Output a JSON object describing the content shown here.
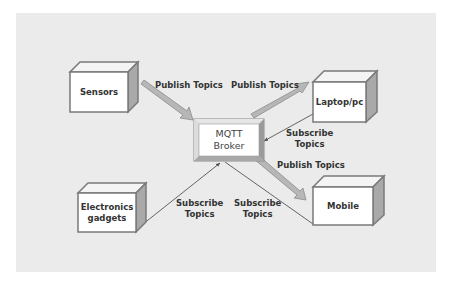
{
  "diagram": {
    "type": "mqtt-architecture",
    "colors": {
      "background_panel": "#ebebeb",
      "box_fill": "#ffffff",
      "box_border": "#7a7a7a",
      "box_side": "#a9a9a9",
      "box_top": "#f4f4f4",
      "publish_arrow": "#b5b5b5",
      "subscribe_line": "#555555"
    },
    "broker": {
      "line1": "MQTT",
      "line2": "Broker"
    },
    "nodes": [
      {
        "id": "sensors",
        "label": "Sensors"
      },
      {
        "id": "laptop",
        "label": "Laptop/pc"
      },
      {
        "id": "electronics",
        "line1": "Electronics",
        "line2": "gadgets"
      },
      {
        "id": "mobile",
        "label": "Mobile"
      }
    ],
    "edges": [
      {
        "from": "sensors",
        "to": "broker",
        "kind": "publish",
        "label": "Publish Topics"
      },
      {
        "from": "broker",
        "to": "laptop",
        "kind": "publish",
        "label": "Publish Topics"
      },
      {
        "from": "laptop",
        "to": "broker",
        "kind": "subscribe",
        "line1": "Subscribe",
        "line2": "Topics"
      },
      {
        "from": "broker",
        "to": "mobile",
        "kind": "publish",
        "label": "Publish Topics"
      },
      {
        "from": "electronics",
        "to": "broker",
        "kind": "subscribe",
        "line1": "Subscribe",
        "line2": "Topics"
      },
      {
        "from": "mobile",
        "to": "broker",
        "kind": "subscribe",
        "line1": "Subscribe",
        "line2": "Topics"
      }
    ]
  }
}
